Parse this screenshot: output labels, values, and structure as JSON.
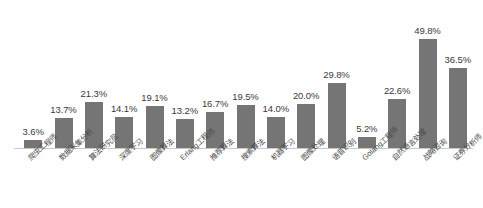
{
  "chart_data": {
    "type": "bar",
    "title": "",
    "subtitle": "",
    "xlabel": "",
    "ylabel": "",
    "ylim": [
      0,
      55
    ],
    "grid": false,
    "legend": null,
    "bar_color": "#757575",
    "axis_color": "#c9c9c9",
    "label_color": "#3a3a3a",
    "background": "#ffffff",
    "value_suffix": "%",
    "categories": [
      "爬虫工程师",
      "数据采集分析",
      "算法研究员",
      "深度学习",
      "图像算法",
      "Erlang工程师",
      "推荐算法",
      "搜索算法",
      "机器学习",
      "图像处理",
      "语音识别",
      "Golang工程师",
      "自然语言处理",
      "战略咨询",
      "证券分析师"
    ],
    "values": [
      3.6,
      13.7,
      21.3,
      14.1,
      19.1,
      13.2,
      16.7,
      19.5,
      14.0,
      20.0,
      29.8,
      5.2,
      22.6,
      49.8,
      36.5
    ],
    "value_labels": [
      "3.6%",
      "13.7%",
      "21.3%",
      "14.1%",
      "19.1%",
      "13.2%",
      "16.7%",
      "19.5%",
      "14.0%",
      "20.0%",
      "29.8%",
      "5.2%",
      "22.6%",
      "49.8%",
      "36.5%"
    ]
  }
}
